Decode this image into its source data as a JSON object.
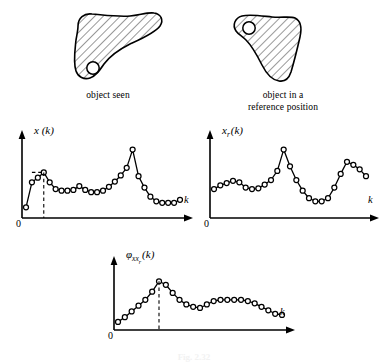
{
  "figure": {
    "caption": "Fig. 2.32",
    "objects": [
      {
        "id": "object-seen",
        "caption": "object seen"
      },
      {
        "id": "object-reference",
        "caption_line1": "object in a",
        "caption_line2": "reference position"
      }
    ]
  },
  "charts": [
    {
      "id": "signature-seen",
      "ylabel": "x (k)",
      "xlabel": "k",
      "origin_label": "0",
      "marker": "open-circle",
      "dashed_marker": true
    },
    {
      "id": "signature-reference",
      "ylabel": "x",
      "ylabel_sub": "r",
      "ylabel_tail": "(k)",
      "xlabel": "k",
      "origin_label": "0",
      "marker": "open-circle",
      "dashed_marker": false
    },
    {
      "id": "cross-correlation",
      "ylabel": "φ",
      "ylabel_sub": "xx",
      "ylabel_sub2": "r",
      "ylabel_tail": "(k)",
      "xlabel": "k",
      "origin_label": "0",
      "marker": "open-circle",
      "dashed_marker": true
    }
  ],
  "chart_data": [
    {
      "type": "line",
      "id": "signature-seen",
      "title": "x (k)",
      "xlabel": "k",
      "ylabel": "x (k)",
      "grid": false,
      "legend": "none",
      "xlim": [
        0,
        27
      ],
      "ylim": [
        0,
        100
      ],
      "marker": "open-circle",
      "annotations": [
        {
          "type": "dashed-vline",
          "x": 3,
          "label": ""
        }
      ],
      "x": [
        0,
        1,
        2,
        3,
        4,
        5,
        6,
        7,
        8,
        9,
        10,
        11,
        12,
        13,
        14,
        15,
        16,
        17,
        18,
        19,
        20,
        21,
        22,
        23,
        24,
        25,
        26
      ],
      "values": [
        14,
        47,
        53,
        60,
        47,
        38,
        36,
        36,
        37,
        42,
        37,
        34,
        34,
        36,
        41,
        48,
        56,
        66,
        90,
        55,
        40,
        28,
        22,
        20,
        20,
        20,
        24
      ]
    },
    {
      "type": "line",
      "id": "signature-reference",
      "title": "x_r (k)",
      "xlabel": "k",
      "ylabel": "x_r (k)",
      "grid": false,
      "legend": "none",
      "xlim": [
        0,
        24
      ],
      "ylim": [
        0,
        100
      ],
      "marker": "open-circle",
      "annotations": [],
      "x": [
        0,
        1,
        2,
        3,
        4,
        5,
        6,
        7,
        8,
        9,
        10,
        11,
        12,
        13,
        14,
        15,
        16,
        17,
        18,
        19,
        20,
        21,
        22,
        23
      ],
      "values": [
        38,
        43,
        46,
        49,
        47,
        40,
        38,
        39,
        44,
        50,
        62,
        90,
        68,
        50,
        36,
        26,
        22,
        22,
        26,
        40,
        58,
        74,
        70,
        64,
        55
      ]
    },
    {
      "type": "line",
      "id": "cross-correlation",
      "title": "φ_xx_r (k)",
      "xlabel": "k",
      "ylabel": "φ_xx_r (k)",
      "grid": false,
      "legend": "none",
      "xlim": [
        0,
        25
      ],
      "ylim": [
        0,
        100
      ],
      "marker": "open-circle",
      "annotations": [
        {
          "type": "dashed-vline",
          "x": 6,
          "label": ""
        }
      ],
      "x": [
        0,
        1,
        2,
        3,
        4,
        5,
        6,
        7,
        8,
        9,
        10,
        11,
        12,
        13,
        14,
        15,
        16,
        17,
        18,
        19,
        20,
        21,
        22,
        23,
        24
      ],
      "values": [
        14,
        22,
        32,
        42,
        52,
        66,
        84,
        78,
        64,
        52,
        44,
        40,
        38,
        44,
        50,
        52,
        52,
        52,
        52,
        50,
        46,
        40,
        34,
        28,
        26
      ]
    }
  ]
}
